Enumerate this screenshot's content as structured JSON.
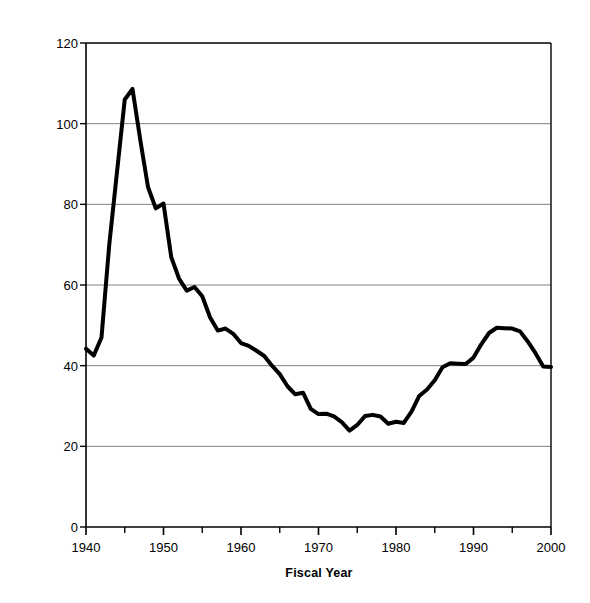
{
  "chart_data": {
    "type": "line",
    "title": "",
    "xlabel": "Fiscal Year",
    "ylabel": "Percent of GDP",
    "xlim": [
      1940,
      2000
    ],
    "ylim": [
      0,
      120
    ],
    "ytick_labels": [
      "0",
      "20",
      "40",
      "60",
      "80",
      "100",
      "120"
    ],
    "ytick_values": [
      0,
      20,
      40,
      60,
      80,
      100,
      120
    ],
    "xtick_labels": [
      "1940",
      "1950",
      "1960",
      "1970",
      "1980",
      "1990",
      "2000"
    ],
    "xtick_values": [
      1940,
      1950,
      1960,
      1970,
      1980,
      1990,
      2000
    ],
    "minor_xtick_values": [
      1945,
      1955,
      1965,
      1975,
      1985,
      1995
    ],
    "grid": "horizontal",
    "legend": "none",
    "line_color": "#000000",
    "line_width": 4,
    "series": [
      {
        "name": "Debt held by the public",
        "x": [
          1940,
          1941,
          1942,
          1943,
          1944,
          1945,
          1946,
          1947,
          1948,
          1949,
          1950,
          1951,
          1952,
          1953,
          1954,
          1955,
          1956,
          1957,
          1958,
          1959,
          1960,
          1961,
          1962,
          1963,
          1964,
          1965,
          1966,
          1967,
          1968,
          1969,
          1970,
          1971,
          1972,
          1973,
          1974,
          1975,
          1976,
          1977,
          1978,
          1979,
          1980,
          1981,
          1982,
          1983,
          1984,
          1985,
          1986,
          1987,
          1988,
          1989,
          1990,
          1991,
          1992,
          1993,
          1994,
          1995,
          1996,
          1997,
          1998,
          1999,
          2000
        ],
        "values": [
          44.2,
          42.5,
          47.0,
          70.0,
          88.0,
          106.0,
          108.6,
          96.0,
          84.3,
          79.0,
          80.2,
          66.9,
          61.6,
          58.6,
          59.5,
          57.2,
          52.0,
          48.7,
          49.2,
          47.9,
          45.6,
          44.9,
          43.7,
          42.4,
          40.0,
          37.9,
          34.9,
          32.9,
          33.3,
          29.3,
          28.0,
          28.1,
          27.4,
          26.0,
          23.9,
          25.3,
          27.5,
          27.8,
          27.4,
          25.6,
          26.1,
          25.8,
          28.6,
          32.5,
          34.1,
          36.4,
          39.6,
          40.6,
          40.5,
          40.4,
          42.0,
          45.3,
          48.1,
          49.4,
          49.3,
          49.2,
          48.5,
          46.0,
          43.1,
          39.8,
          39.7
        ]
      }
    ]
  }
}
